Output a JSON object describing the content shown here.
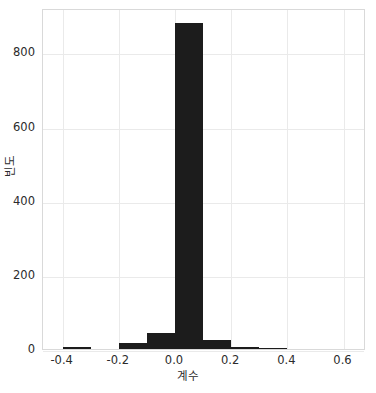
{
  "chart_data": {
    "type": "bar",
    "title": "",
    "subtitle": "",
    "xlabel": "계수",
    "ylabel": "빈도",
    "xlim": [
      -0.47,
      0.68
    ],
    "ylim": [
      0,
      920
    ],
    "grid": true,
    "legend": null,
    "bin_width": 0.1,
    "categories": [
      "-0.35",
      "-0.25",
      "-0.15",
      "-0.05",
      "0.05",
      "0.15",
      "0.25",
      "0.35"
    ],
    "bin_edges": [
      -0.4,
      -0.3,
      -0.2,
      -0.1,
      0.0,
      0.1,
      0.2,
      0.3,
      0.4
    ],
    "values": [
      5,
      0,
      15,
      42,
      880,
      25,
      5,
      2
    ],
    "xticks": [
      "-0.4",
      "-0.2",
      "0.0",
      "0.2",
      "0.4",
      "0.6"
    ],
    "xtick_values": [
      -0.4,
      -0.2,
      0.0,
      0.2,
      0.4,
      0.6
    ],
    "yticks": [
      "0",
      "200",
      "400",
      "600",
      "800"
    ],
    "ytick_values": [
      0,
      200,
      400,
      600,
      800
    ],
    "bar_color": "#1c1c1c",
    "grid_color": "#eaeaea",
    "spine_color": "#d9d9d9",
    "background": "#ffffff"
  },
  "caption": {
    "text": ""
  }
}
